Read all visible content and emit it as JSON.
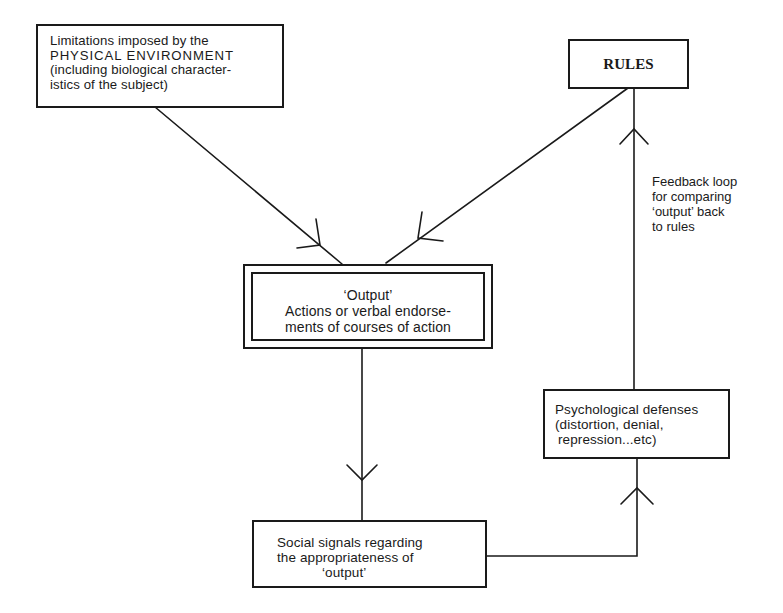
{
  "diagram": {
    "nodes": {
      "environment": {
        "lines": [
          "Limitations imposed by the",
          "PHYSICAL ENVIRONMENT",
          "(including biological character-",
          "istics of the subject)"
        ]
      },
      "rules": {
        "label": "RULES"
      },
      "output": {
        "lines": [
          "‘Output’",
          "Actions or verbal endorse-",
          "ments of courses of action"
        ]
      },
      "psychological_defenses": {
        "lines": [
          "Psychological defenses",
          "(distortion, denial,",
          "repression...etc)"
        ]
      },
      "social_signals": {
        "lines": [
          "Social signals regarding",
          "the appropriateness of",
          "‘output’"
        ]
      }
    },
    "annotations": {
      "feedback_loop": {
        "lines": [
          "Feedback loop",
          "for comparing",
          "‘output’ back",
          "to rules"
        ]
      }
    },
    "edges": [
      {
        "from": "environment",
        "to": "output"
      },
      {
        "from": "rules",
        "to": "output"
      },
      {
        "from": "output",
        "to": "social_signals"
      },
      {
        "from": "social_signals",
        "to": "psychological_defenses"
      },
      {
        "from": "psychological_defenses",
        "to": "rules",
        "label": "feedback_loop"
      }
    ],
    "colors": {
      "ink": "#1a1a1a",
      "background": "#ffffff"
    }
  }
}
